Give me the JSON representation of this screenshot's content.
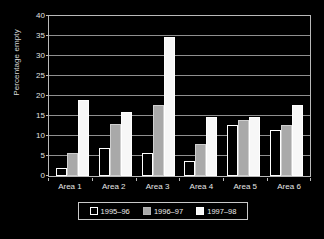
{
  "chart_data": {
    "type": "bar",
    "title": "",
    "xlabel": "",
    "ylabel": "Percentage empty",
    "ylim": [
      0,
      40
    ],
    "ytick_step": 5,
    "yticks": [
      0,
      5,
      10,
      15,
      20,
      25,
      30,
      35,
      40
    ],
    "grid": true,
    "legend_position": "bottom",
    "categories": [
      "Area 1",
      "Area 2",
      "Area 3",
      "Area 4",
      "Area 5",
      "Area 6"
    ],
    "series": [
      {
        "name": "1995–96",
        "color": "#000000",
        "edge": "#ffffff",
        "values": [
          2.0,
          7.0,
          5.7,
          3.7,
          12.7,
          11.6
        ]
      },
      {
        "name": "1996–97",
        "color": "#a9a9a9",
        "edge": "#cfcfcf",
        "values": [
          5.7,
          12.9,
          17.8,
          7.9,
          14.0,
          12.7
        ]
      },
      {
        "name": "1997–98",
        "color": "#f7f7f7",
        "edge": "#ffffff",
        "values": [
          19.1,
          16.0,
          34.8,
          14.8,
          14.8,
          17.7
        ]
      }
    ]
  },
  "colors": {
    "background": "#000000",
    "axis": "#b9b9b9",
    "grid": "#8f8f8f",
    "text": "#e8e8e8"
  }
}
